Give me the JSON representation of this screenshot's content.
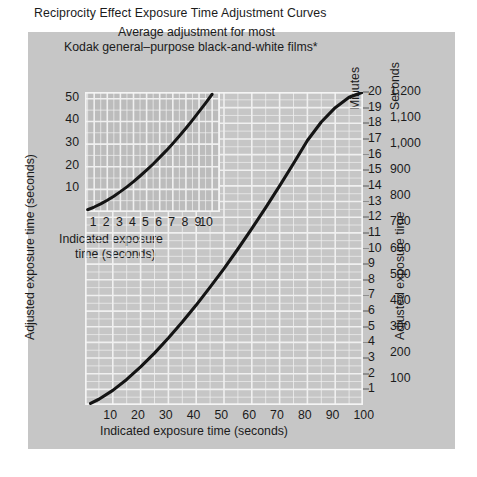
{
  "figure": {
    "background": "#ffffff",
    "plate_color": "#c6c6c6",
    "ink_color": "#141414",
    "grid_color": "#f0f0f0"
  },
  "titles": {
    "main": "Reciprocity Effect Exposure Time Adjustment Curves",
    "sub1": "Average adjustment for most",
    "sub2": "Kodak general–purpose black-and-white films*"
  },
  "axis_titles": {
    "y_left": "Adjusted exposure time (seconds)",
    "x_main": "Indicated exposure time (seconds)",
    "y_right_minutes": "Minutes",
    "y_right_seconds": "Seconds",
    "y_right_label": "Adjusted exposure time",
    "inset_x_line1": "Indicated exposure",
    "inset_x_line2": "time (seconds)"
  },
  "chart_data": {
    "type": "line",
    "title": "Reciprocity Effect Exposure Time Adjustment Curves",
    "subtitle": "Average adjustment for most Kodak general–purpose black-and-white films*",
    "grid": true,
    "legend": "none",
    "panels": [
      {
        "name": "main",
        "xlabel": "Indicated exposure time (seconds)",
        "ylabel": "Adjusted exposure time (seconds)",
        "xlim": [
          0,
          100
        ],
        "ylim": [
          0,
          1200
        ],
        "xticks": [
          10,
          20,
          30,
          40,
          50,
          60,
          70,
          80,
          90,
          100
        ],
        "xticklabels": [
          "10",
          "20",
          "30",
          "40",
          "50",
          "60",
          "70",
          "80",
          "90",
          "100"
        ],
        "y_right_minutes_ticks": [
          1,
          2,
          3,
          4,
          5,
          6,
          7,
          8,
          9,
          10,
          11,
          12,
          13,
          14,
          15,
          16,
          17,
          18,
          19,
          20
        ],
        "y_right_minutes_labels": [
          "1",
          "2",
          "3",
          "4",
          "5",
          "6",
          "7",
          "8",
          "9",
          "10",
          "11",
          "12",
          "13",
          "14",
          "15",
          "16",
          "17",
          "18",
          "19",
          "20"
        ],
        "y_right_seconds_ticks": [
          100,
          200,
          300,
          400,
          500,
          600,
          700,
          800,
          900,
          1000,
          1100,
          1200
        ],
        "y_right_seconds_labels": [
          "100",
          "200",
          "300",
          "400",
          "500",
          "600",
          "700",
          "800",
          "900",
          "1,000",
          "1,100",
          "1,200"
        ],
        "series": [
          {
            "name": "Adjusted exposure time vs indicated exposure time",
            "x": [
              2,
              5,
              10,
              15,
              20,
              25,
              30,
              35,
              40,
              45,
              50,
              55,
              60,
              65,
              70,
              75,
              80,
              85,
              90,
              95,
              100
            ],
            "y": [
              6,
              22,
              56,
              98,
              146,
              199,
              257,
              318,
              383,
              452,
              523,
              598,
              676,
              757,
              840,
              926,
              1014,
              1085,
              1140,
              1180,
              1200
            ]
          }
        ]
      },
      {
        "name": "inset",
        "xlabel": "Indicated exposure time (seconds)",
        "ylabel": "Adjusted exposure time (seconds)",
        "xlim": [
          0.3,
          10.6
        ],
        "ylim": [
          0,
          53
        ],
        "xticks": [
          1,
          2,
          3,
          4,
          5,
          6,
          7,
          8,
          9,
          10
        ],
        "xticklabels": [
          "1",
          "2",
          "3",
          "4",
          "5",
          "6",
          "7",
          "8",
          "9",
          "10"
        ],
        "yticks": [
          10,
          20,
          30,
          40,
          50
        ],
        "yticklabels": [
          "10",
          "20",
          "30",
          "40",
          "50"
        ],
        "series": [
          {
            "name": "Adjusted exposure time vs indicated exposure time (1–10 s)",
            "x": [
              0.5,
              1,
              1.5,
              2,
              2.5,
              3,
              3.5,
              4,
              4.5,
              5,
              5.5,
              6,
              6.5,
              7,
              7.5,
              8,
              8.5,
              9,
              9.5,
              10
            ],
            "y": [
              1.0,
              2.2,
              3.6,
              5.2,
              7.0,
              9.0,
              11.1,
              13.4,
              15.9,
              18.5,
              21.2,
              24.1,
              27.1,
              30.3,
              33.6,
              37.0,
              40.6,
              44.3,
              48.1,
              52.0
            ]
          }
        ]
      }
    ]
  }
}
